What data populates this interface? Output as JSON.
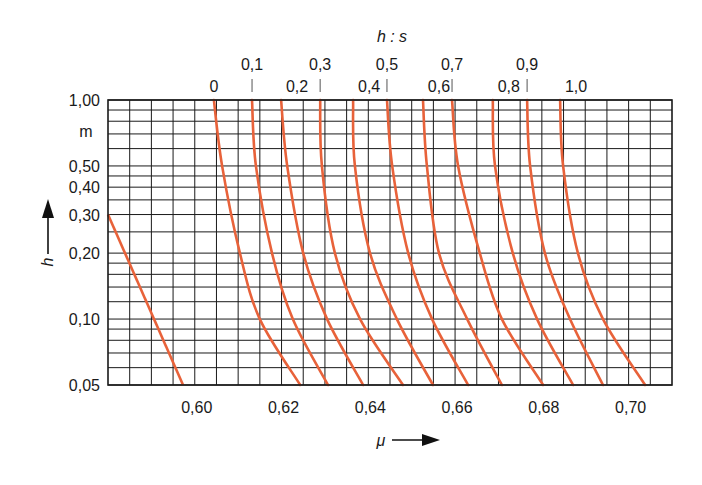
{
  "chart_data": {
    "type": "line",
    "title": "",
    "top_axis_title": "h : s",
    "xlabel": "μ",
    "ylabel": "h",
    "y_unit": "m",
    "xlim": [
      0.58,
      0.71
    ],
    "ylim": [
      0.05,
      1.0
    ],
    "y_scale": "log",
    "grid": true,
    "x_tick_step_minor": 0.005,
    "x_tick_labels": [
      "0,60",
      "0,62",
      "0,64",
      "0,66",
      "0,68",
      "0,70"
    ],
    "x_ticks": [
      0.6,
      0.62,
      0.64,
      0.66,
      0.68,
      0.7
    ],
    "y_tick_labels": [
      "1,00",
      "m",
      "0,50",
      "0,40",
      "0,30",
      "0,20",
      "0,10",
      "0,05"
    ],
    "y_ticks": [
      1.0,
      null,
      0.5,
      0.4,
      0.3,
      0.2,
      0.1,
      0.05
    ],
    "y_grid_lines": [
      1.0,
      0.9,
      0.8,
      0.7,
      0.6,
      0.5,
      0.45,
      0.4,
      0.35,
      0.3,
      0.25,
      0.2,
      0.18,
      0.16,
      0.14,
      0.12,
      0.1,
      0.09,
      0.08,
      0.07,
      0.06,
      0.05
    ],
    "top_labels_row1": [
      "0,1",
      "0,3",
      "0,5",
      "0,7",
      "0,9"
    ],
    "top_labels_row2": [
      "0",
      "0,2",
      "0,4",
      "0,6",
      "0,8",
      "1,0"
    ],
    "line_color": "#e8623a",
    "h_sample_points": [
      1.0,
      0.5,
      0.2,
      0.1,
      0.05
    ],
    "series": [
      {
        "name": "0",
        "mu": [
          0.6044,
          0.6063,
          0.6104,
          0.615,
          0.6243
        ]
      },
      {
        "name": "0,1",
        "mu": [
          0.6132,
          0.6141,
          0.6178,
          0.6226,
          0.6307
        ]
      },
      {
        "name": "0,2",
        "mu": [
          0.6199,
          0.6213,
          0.625,
          0.6305,
          0.6388
        ]
      },
      {
        "name": "0,3",
        "mu": [
          0.6289,
          0.6293,
          0.6323,
          0.6381,
          0.648
        ]
      },
      {
        "name": "0,4",
        "mu": [
          0.6365,
          0.6369,
          0.6404,
          0.6466,
          0.6549
        ]
      },
      {
        "name": "0,5",
        "mu": [
          0.6443,
          0.6455,
          0.6492,
          0.6547,
          0.663
        ]
      },
      {
        "name": "0,6",
        "mu": [
          0.6526,
          0.6535,
          0.6563,
          0.6628,
          0.6708
        ]
      },
      {
        "name": "0,7",
        "mu": [
          0.6593,
          0.6607,
          0.6657,
          0.6708,
          0.6803
        ]
      },
      {
        "name": "0,8",
        "mu": [
          0.6687,
          0.6692,
          0.6733,
          0.6789,
          0.6872
        ]
      },
      {
        "name": "0,9",
        "mu": [
          0.6766,
          0.6773,
          0.6807,
          0.6865,
          0.6941
        ]
      },
      {
        "name": "1,0",
        "mu": [
          0.6842,
          0.6849,
          0.6883,
          0.6941,
          0.7038
        ]
      }
    ],
    "limit_line": {
      "name": "boundary",
      "points": [
        [
          0.58,
          0.3
        ],
        [
          0.5973,
          0.05
        ]
      ]
    }
  }
}
